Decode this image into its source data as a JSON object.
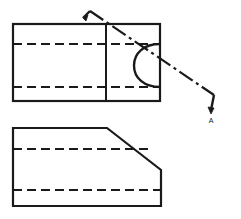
{
  "drawing": {
    "title": "Orthographic projection with cutting plane",
    "background_color": "#ffffff",
    "line_color": "#1a1a1a",
    "canvas": {
      "width": 241,
      "height": 219
    },
    "top_view": {
      "name": "top-view",
      "outline_label": "rectangular outline",
      "rect": {
        "x": 13,
        "y": 24,
        "width": 147,
        "height": 77
      },
      "vertical_divider_x": 106,
      "hidden_lines": [
        {
          "label": "upper hidden edge",
          "y": 44,
          "x1": 13,
          "x2": 160
        },
        {
          "label": "lower hidden edge",
          "y": 87,
          "x1": 13,
          "x2": 160
        }
      ],
      "arc_feature": {
        "label": "semicircular slot",
        "center_x": 160,
        "center_y": 65.5,
        "radius": 26,
        "leftmost_x": 134
      }
    },
    "front_view": {
      "name": "front-view",
      "outline_label": "chamfered outline",
      "points": "13,128 107,128 161,170 161,206 13,206",
      "chamfer": {
        "x1": 107,
        "y1": 128,
        "x2": 161,
        "y2": 170
      },
      "hidden_lines": [
        {
          "label": "upper hidden edge",
          "y": 149,
          "x1": 13,
          "x2": 153
        },
        {
          "label": "lower hidden edge",
          "y": 190,
          "x1": 13,
          "x2": 161
        }
      ]
    },
    "cutting_plane": {
      "name": "cutting-plane-line",
      "style": "chain-dash",
      "path": "82,16 90,10 215,95 212,112",
      "arrow_start": {
        "x": 82,
        "y": 16,
        "direction": "down-left"
      },
      "arrow_end": {
        "x": 212,
        "y": 115,
        "direction": "down"
      },
      "label": "A",
      "label_x": 214,
      "label_y": 122
    }
  }
}
